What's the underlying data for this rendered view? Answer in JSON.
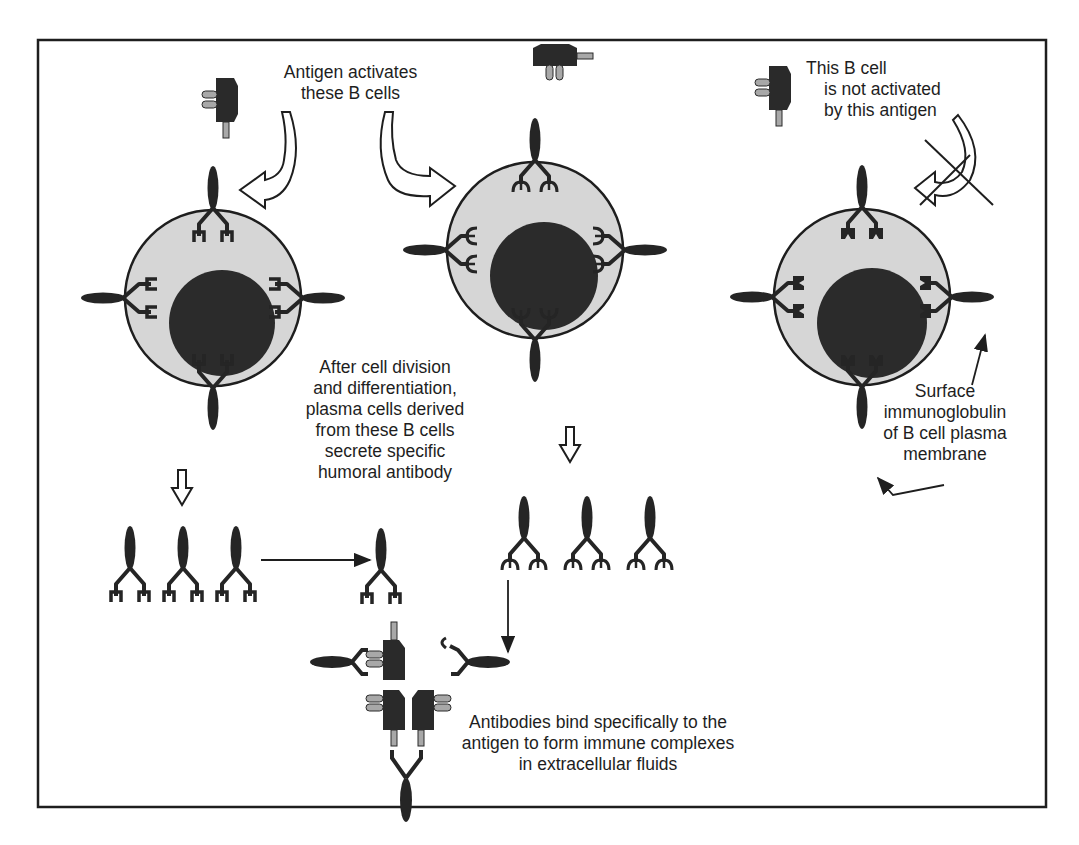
{
  "figure": {
    "colors": {
      "frame": "#1e1e1e",
      "cytoplasm": "#d6d6d6",
      "nucleus": "#2b2b2b",
      "antibody": "#252525",
      "antigen_body": "#2a2a2a",
      "antigen_prong": "#a8a8a8"
    }
  },
  "labels": {
    "activates": [
      "Antigen activates",
      "these B cells"
    ],
    "not_activated": [
      "This B cell",
      "is not activated",
      "by this antigen"
    ],
    "division": [
      "After cell division",
      "and differentiation,",
      "plasma cells derived",
      "from these B cells",
      "secrete specific",
      "humoral antibody"
    ],
    "surface": [
      "Surface",
      "immunoglobulin",
      "of B cell plasma",
      "membrane"
    ],
    "complex": [
      "Antibodies bind specifically to the",
      "antigen to form immune complexes",
      "in extracellular fluids"
    ]
  },
  "cells": [
    {
      "name": "b-cell-activated-1",
      "cx": 213,
      "cy": 298,
      "r": 88,
      "ncx": 222,
      "ncy": 323,
      "nr": 53,
      "receptor": "square"
    },
    {
      "name": "b-cell-activated-2",
      "cx": 535,
      "cy": 250,
      "r": 88,
      "ncx": 544,
      "ncy": 276,
      "nr": 54,
      "receptor": "claw"
    },
    {
      "name": "b-cell-not-activated",
      "cx": 862,
      "cy": 297,
      "r": 88,
      "ncx": 872,
      "ncy": 323,
      "nr": 55,
      "receptor": "notch"
    }
  ]
}
